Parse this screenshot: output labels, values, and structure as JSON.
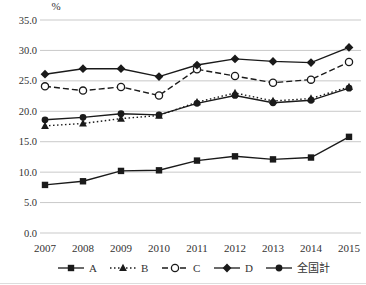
{
  "chart_data": {
    "type": "line",
    "unit_label": "%",
    "x": [
      2007,
      2008,
      2009,
      2010,
      2011,
      2012,
      2013,
      2014,
      2015
    ],
    "x_tick_labels": [
      "2007",
      "2008",
      "2009",
      "2010",
      "2011",
      "2012",
      "2013",
      "2014",
      "2015"
    ],
    "ylim": [
      0.0,
      35.0
    ],
    "ytick_step": 5.0,
    "y_tick_labels": [
      "0.0",
      "5.0",
      "10.0",
      "15.0",
      "20.0",
      "25.0",
      "30.0",
      "35.0"
    ],
    "grid": true,
    "legend_position": "bottom",
    "line_color": "#1a1a1a",
    "grid_color": "#c9c9c9",
    "text_color": "#333333",
    "series": [
      {
        "name": "A",
        "marker": "square-filled",
        "line_style": "solid",
        "values": [
          7.9,
          8.5,
          10.2,
          10.3,
          11.9,
          12.6,
          12.1,
          12.4,
          15.8
        ]
      },
      {
        "name": "B",
        "marker": "triangle-filled",
        "line_style": "dotted",
        "values": [
          17.6,
          18.0,
          18.8,
          19.3,
          21.5,
          23.0,
          21.7,
          22.1,
          24.0
        ]
      },
      {
        "name": "C",
        "marker": "circle-open",
        "line_style": "dashed",
        "values": [
          24.1,
          23.4,
          24.0,
          22.6,
          26.9,
          25.8,
          24.7,
          25.2,
          28.1
        ]
      },
      {
        "name": "D",
        "marker": "diamond-filled",
        "line_style": "solid",
        "values": [
          26.1,
          27.0,
          27.0,
          25.7,
          27.6,
          28.6,
          28.2,
          28.0,
          30.5
        ]
      },
      {
        "name": "全国計",
        "marker": "circle-filled",
        "line_style": "solid",
        "values": [
          18.6,
          19.0,
          19.6,
          19.4,
          21.3,
          22.6,
          21.4,
          21.8,
          23.8
        ]
      }
    ]
  }
}
